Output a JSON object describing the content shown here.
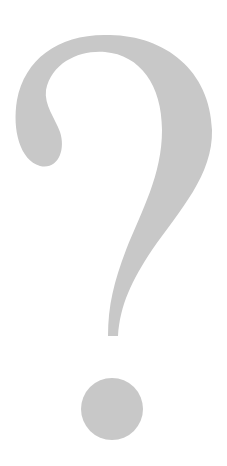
{
  "image": {
    "subject": "question mark",
    "glyph": "?",
    "colors": {
      "background": "#ffffff",
      "glyph": "#c8c8c8"
    }
  }
}
